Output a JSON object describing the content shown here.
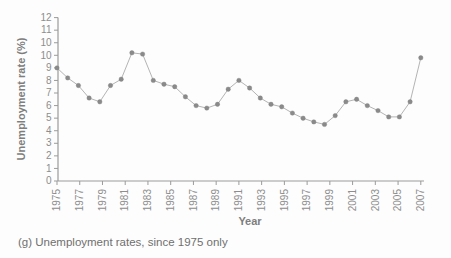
{
  "figure": {
    "caption": "(g) Unemployment rates, since 1975 only"
  },
  "chart_data": {
    "type": "line",
    "title": "",
    "xlabel": "Year",
    "ylabel": "Unemployment rate (%)",
    "x": [
      1975,
      1976,
      1977,
      1978,
      1979,
      1980,
      1981,
      1982,
      1983,
      1984,
      1985,
      1986,
      1987,
      1988,
      1989,
      1990,
      1991,
      1992,
      1993,
      1994,
      1995,
      1996,
      1997,
      1998,
      1999,
      2000,
      2001,
      2002,
      2003,
      2004,
      2005,
      2006,
      2007,
      2008,
      2009
    ],
    "values": [
      9.0,
      8.2,
      7.6,
      6.6,
      6.3,
      7.6,
      8.1,
      10.2,
      10.1,
      8.0,
      7.7,
      7.5,
      6.7,
      6.0,
      5.8,
      6.1,
      7.3,
      8.0,
      7.4,
      6.6,
      6.1,
      5.9,
      5.4,
      5.0,
      4.7,
      4.5,
      5.2,
      6.3,
      6.5,
      6.0,
      5.6,
      5.1,
      5.1,
      6.3,
      9.8
    ],
    "x_tick_labels": [
      "1975",
      "1977",
      "1979",
      "1981",
      "1983",
      "1985",
      "1987",
      "1989",
      "1991",
      "1993",
      "1995",
      "1997",
      "1999",
      "2001",
      "2003",
      "2005",
      "2007"
    ],
    "y_tick_labels_bottom_to_top": [
      "0",
      "1",
      "2",
      "3",
      "4",
      "5",
      "6",
      "7",
      "8",
      "9",
      "10",
      "10",
      "11",
      "12"
    ],
    "ylim_tick_units": [
      0,
      13
    ],
    "grid": false,
    "legend": false,
    "marker": "circle"
  },
  "colors": {
    "background": "#fdfdfd",
    "axis": "#9b9b9b",
    "tick_text": "#8d8d8d",
    "axis_title_text": "#7e7e7e",
    "series_line": "#b4b4b4",
    "marker": "#8a8a8a",
    "caption_text": "#6f6f6f"
  }
}
